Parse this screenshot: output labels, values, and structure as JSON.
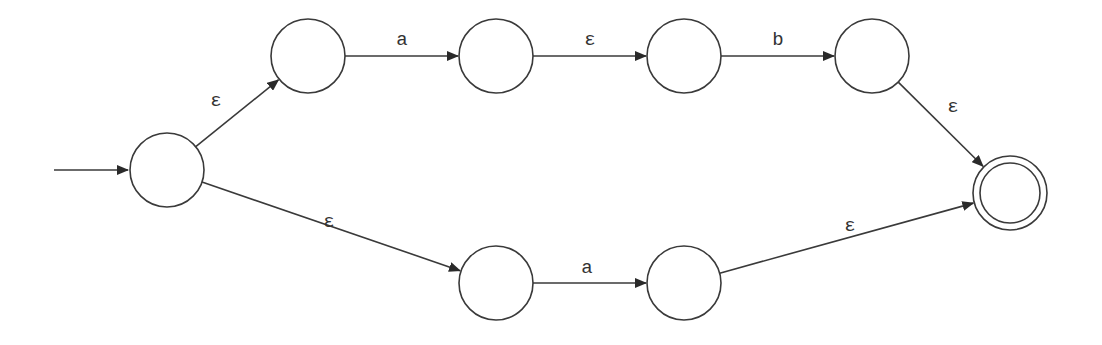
{
  "diagram": {
    "type": "nfa",
    "colors": {
      "stroke": "#3a3a3a",
      "background": "#ffffff",
      "text": "#333333"
    },
    "states": [
      {
        "id": "s0",
        "x": 167,
        "y": 170,
        "r": 37,
        "start": true,
        "accept": false
      },
      {
        "id": "s1",
        "x": 308,
        "y": 56,
        "r": 37,
        "start": false,
        "accept": false
      },
      {
        "id": "s2",
        "x": 496,
        "y": 56,
        "r": 37,
        "start": false,
        "accept": false
      },
      {
        "id": "s3",
        "x": 684,
        "y": 56,
        "r": 37,
        "start": false,
        "accept": false
      },
      {
        "id": "s4",
        "x": 872,
        "y": 56,
        "r": 37,
        "start": false,
        "accept": false
      },
      {
        "id": "s5",
        "x": 496,
        "y": 283,
        "r": 37,
        "start": false,
        "accept": false
      },
      {
        "id": "s6",
        "x": 684,
        "y": 283,
        "r": 37,
        "start": false,
        "accept": false
      },
      {
        "id": "s7",
        "x": 1010,
        "y": 193,
        "r": 37,
        "start": false,
        "accept": true
      }
    ],
    "transitions": [
      {
        "from": "s0",
        "to": "s1",
        "label": "ε",
        "lx": 216,
        "ly": 101
      },
      {
        "from": "s1",
        "to": "s2",
        "label": "a",
        "lx": 402,
        "ly": 40
      },
      {
        "from": "s2",
        "to": "s3",
        "label": "ε",
        "lx": 590,
        "ly": 40
      },
      {
        "from": "s3",
        "to": "s4",
        "label": "b",
        "lx": 778,
        "ly": 40
      },
      {
        "from": "s4",
        "to": "s7",
        "label": "ε",
        "lx": 953,
        "ly": 107
      },
      {
        "from": "s0",
        "to": "s5",
        "label": "ε",
        "lx": 329,
        "ly": 222
      },
      {
        "from": "s5",
        "to": "s6",
        "label": "a",
        "lx": 587,
        "ly": 268
      },
      {
        "from": "s6",
        "to": "s7",
        "label": "ε",
        "lx": 850,
        "ly": 226
      }
    ]
  }
}
